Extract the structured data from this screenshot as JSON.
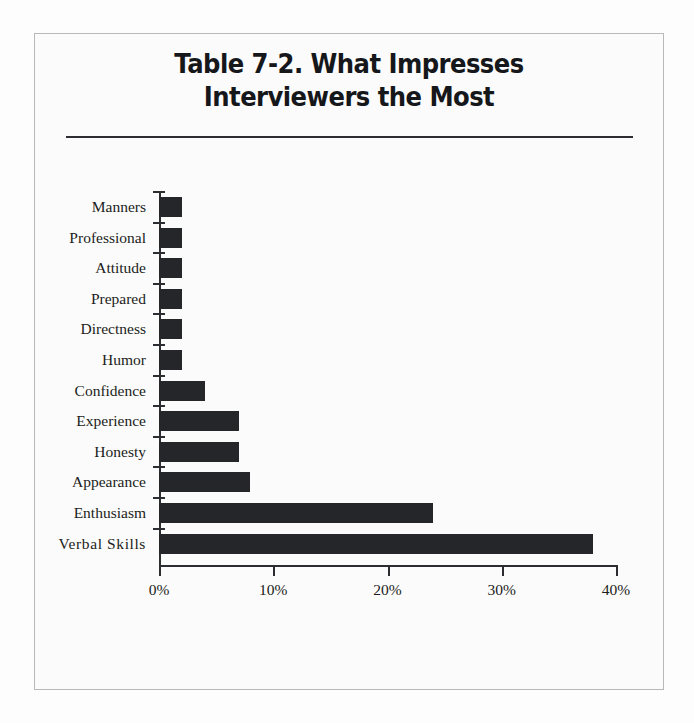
{
  "figure": {
    "title_line1": "Table 7-2. What Impresses",
    "title_line2": "Interviewers the Most",
    "bar_color": "#24262a",
    "axis_color": "#2b2d31",
    "background": "#fbfbfb",
    "frame_color": "#b9b9b9"
  },
  "chart_data": {
    "type": "bar",
    "orientation": "horizontal",
    "title": "Table 7-2. What Impresses Interviewers the Most",
    "xlabel": "",
    "ylabel": "",
    "categories": [
      "Manners",
      "Professional",
      "Attitude",
      "Prepared",
      "Directness",
      "Humor",
      "Confidence",
      "Experience",
      "Honesty",
      "Appearance",
      "Enthusiasm",
      "Verbal Skills"
    ],
    "values": [
      2,
      2,
      2,
      2,
      2,
      2,
      4,
      7,
      7,
      8,
      24,
      38
    ],
    "value_suffix": "%",
    "xlim": [
      0,
      40
    ],
    "xticks": [
      0,
      10,
      20,
      30,
      40
    ],
    "xticklabels": [
      "0%",
      "10%",
      "20%",
      "30%",
      "40%"
    ],
    "grid": false,
    "legend": false
  }
}
